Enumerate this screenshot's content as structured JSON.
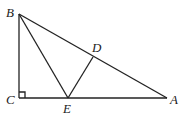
{
  "diagram": {
    "type": "geometry",
    "points": {
      "B": {
        "label": "B",
        "x": 19,
        "y": 14
      },
      "C": {
        "label": "C",
        "x": 19,
        "y": 98
      },
      "E": {
        "label": "E",
        "x": 68,
        "y": 98
      },
      "A": {
        "label": "A",
        "x": 167,
        "y": 98
      },
      "D": {
        "label": "D",
        "x": 93,
        "y": 57
      }
    },
    "segments": [
      [
        "B",
        "C"
      ],
      [
        "C",
        "A"
      ],
      [
        "A",
        "B"
      ],
      [
        "B",
        "E"
      ],
      [
        "E",
        "D"
      ]
    ],
    "right_angle_at": "C",
    "colors": {
      "stroke": "#222222",
      "background": "#ffffff"
    }
  }
}
